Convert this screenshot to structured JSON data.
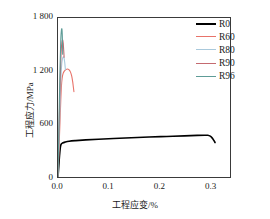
{
  "chart_data": {
    "type": "line",
    "title": "",
    "xlabel": "工程应变/%",
    "ylabel": "工程应力/MPa",
    "xlim": [
      0.0,
      0.34
    ],
    "ylim": [
      0,
      1800
    ],
    "xticks": [
      "0.0",
      "0.1",
      "0.2",
      "0.3"
    ],
    "xtick_values": [
      0.0,
      0.1,
      0.2,
      0.3
    ],
    "yticks": [
      "0",
      "600",
      "1 200",
      "1 800"
    ],
    "ytick_values": [
      0,
      600,
      1200,
      1800
    ],
    "grid": false,
    "legend_position": "top-right",
    "series": [
      {
        "name": "R0",
        "color": "#000000",
        "width": 1.6,
        "points": [
          [
            0.0,
            0
          ],
          [
            0.0015,
            120
          ],
          [
            0.003,
            240
          ],
          [
            0.0045,
            330
          ],
          [
            0.006,
            370
          ],
          [
            0.009,
            385
          ],
          [
            0.014,
            395
          ],
          [
            0.022,
            405
          ],
          [
            0.035,
            412
          ],
          [
            0.055,
            420
          ],
          [
            0.08,
            428
          ],
          [
            0.11,
            436
          ],
          [
            0.145,
            444
          ],
          [
            0.18,
            452
          ],
          [
            0.215,
            459
          ],
          [
            0.25,
            466
          ],
          [
            0.275,
            471
          ],
          [
            0.29,
            473
          ],
          [
            0.296,
            472
          ],
          [
            0.301,
            462
          ],
          [
            0.305,
            440
          ],
          [
            0.3085,
            410
          ],
          [
            0.3105,
            390
          ]
        ]
      },
      {
        "name": "R60",
        "color": "#e8736a",
        "width": 1.1,
        "points": [
          [
            0.0,
            0
          ],
          [
            0.002,
            320
          ],
          [
            0.004,
            640
          ],
          [
            0.0055,
            870
          ],
          [
            0.0068,
            1030
          ],
          [
            0.0082,
            1120
          ],
          [
            0.01,
            1170
          ],
          [
            0.0125,
            1198
          ],
          [
            0.0155,
            1215
          ],
          [
            0.0185,
            1222
          ],
          [
            0.0215,
            1215
          ],
          [
            0.0245,
            1190
          ],
          [
            0.027,
            1145
          ],
          [
            0.029,
            1080
          ],
          [
            0.0305,
            1010
          ],
          [
            0.0315,
            965
          ]
        ]
      },
      {
        "name": "R80",
        "color": "#a9c9dc",
        "width": 1.1,
        "points": [
          [
            0.0,
            0
          ],
          [
            0.0018,
            360
          ],
          [
            0.0036,
            720
          ],
          [
            0.005,
            980
          ],
          [
            0.0062,
            1170
          ],
          [
            0.0074,
            1280
          ],
          [
            0.0086,
            1330
          ],
          [
            0.0098,
            1355
          ],
          [
            0.011,
            1360
          ],
          [
            0.0122,
            1340
          ],
          [
            0.0132,
            1300
          ],
          [
            0.014,
            1255
          ],
          [
            0.0146,
            1215
          ]
        ]
      },
      {
        "name": "R90",
        "color": "#c46a70",
        "width": 1.1,
        "points": [
          [
            0.0,
            0
          ],
          [
            0.0016,
            400
          ],
          [
            0.0032,
            810
          ],
          [
            0.0045,
            1120
          ],
          [
            0.0056,
            1330
          ],
          [
            0.0066,
            1455
          ],
          [
            0.0076,
            1520
          ],
          [
            0.0086,
            1548
          ],
          [
            0.0096,
            1545
          ],
          [
            0.0104,
            1510
          ],
          [
            0.0111,
            1450
          ],
          [
            0.0117,
            1395
          ],
          [
            0.0121,
            1355
          ]
        ]
      },
      {
        "name": "R96",
        "color": "#5e9c97",
        "width": 1.1,
        "points": [
          [
            0.0,
            0
          ],
          [
            0.0014,
            440
          ],
          [
            0.0028,
            880
          ],
          [
            0.004,
            1220
          ],
          [
            0.005,
            1450
          ],
          [
            0.0058,
            1590
          ],
          [
            0.0066,
            1655
          ],
          [
            0.0073,
            1678
          ],
          [
            0.0079,
            1670
          ],
          [
            0.0084,
            1620
          ],
          [
            0.0088,
            1540
          ],
          [
            0.0091,
            1455
          ],
          [
            0.0093,
            1390
          ]
        ]
      }
    ]
  },
  "legend": {
    "items": [
      {
        "label": "R0",
        "color": "#000000"
      },
      {
        "label": "R60",
        "color": "#e8736a"
      },
      {
        "label": "R80",
        "color": "#a9c9dc"
      },
      {
        "label": "R90",
        "color": "#c46a70"
      },
      {
        "label": "R96",
        "color": "#5e9c97"
      }
    ]
  },
  "axes": {
    "y_title": "工程应力/MPa",
    "x_title": "工程应变/%",
    "y_tick_labels": [
      "1 800",
      "1 200",
      "600",
      "0"
    ],
    "x_tick_labels": [
      "0.0",
      "0.1",
      "0.2",
      "0.3"
    ]
  }
}
